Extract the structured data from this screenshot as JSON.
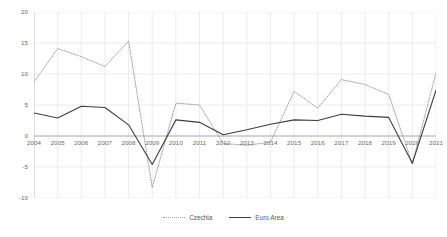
{
  "chart_data": {
    "type": "line",
    "title": "",
    "subtitle": "",
    "xlabel": "",
    "ylabel": "",
    "x": [
      2004,
      2005,
      2006,
      2007,
      2008,
      2009,
      2010,
      2011,
      2012,
      2013,
      2014,
      2015,
      2016,
      2017,
      2018,
      2019,
      2020,
      2021
    ],
    "categories": [
      "2004",
      "2005",
      "2006",
      "2007",
      "2008",
      "2009",
      "2010",
      "2011",
      "2012",
      "2013",
      "2014",
      "2015",
      "2016",
      "2017",
      "2018",
      "2019",
      "2020",
      "2021"
    ],
    "series": [
      {
        "name": "Czechia",
        "style": "dotted",
        "color": "#9a9a9a",
        "values": [
          8.7,
          14.1,
          12.8,
          11.2,
          15.3,
          -8.3,
          5.3,
          5.0,
          -1.2,
          -1.5,
          -1.0,
          7.2,
          4.5,
          9.1,
          8.3,
          6.7,
          -4.5,
          10.2
        ]
      },
      {
        "name": "Euro Area",
        "style": "solid",
        "color": "#3d3d3d",
        "values": [
          3.7,
          2.9,
          4.8,
          4.6,
          1.8,
          -4.6,
          2.6,
          2.2,
          0.2,
          1.0,
          1.9,
          2.6,
          2.5,
          3.5,
          3.2,
          3.0,
          -4.4,
          7.4
        ]
      }
    ],
    "ylim": [
      -10,
      20
    ],
    "yticks": [
      20,
      15,
      10,
      5,
      0,
      -5,
      -10
    ],
    "ytick_labels": [
      "20",
      "15",
      "10",
      "5",
      "0",
      "-5",
      "-10"
    ],
    "xlim": [
      2004,
      2021
    ],
    "grid": true,
    "grid_color": "#e4e4e4",
    "legend_position": "bottom",
    "legend": [
      "Czechia",
      "Euro Area"
    ],
    "axis_color": "#bdbdbd",
    "zero_line_color": "#9e9e9e",
    "background": "#ffffff",
    "tick_label_color": "#6a6a6a"
  }
}
